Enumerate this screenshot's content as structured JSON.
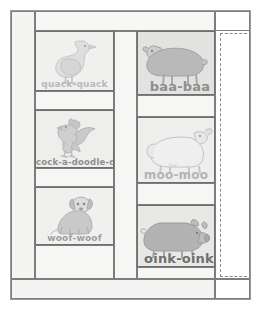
{
  "layout": {
    "top_bar_label": "",
    "bottom_bar_label": "",
    "right_margin_label": ""
  },
  "panels": [
    {
      "id": "duck",
      "animal": "goose",
      "icon": "goose-icon",
      "label": "quack-quack",
      "column": "left",
      "row": 1
    },
    {
      "id": "rooster",
      "animal": "rooster",
      "icon": "rooster-icon",
      "label": "cock-a-doodle-doo",
      "column": "left",
      "row": 2
    },
    {
      "id": "dog",
      "animal": "dog",
      "icon": "dog-icon",
      "label": "woof-woof",
      "column": "left",
      "row": 3
    },
    {
      "id": "sheep",
      "animal": "sheep",
      "icon": "sheep-icon",
      "label": "baa-baa",
      "column": "right",
      "row": 1
    },
    {
      "id": "cow",
      "animal": "cow",
      "icon": "cow-icon",
      "label": "moo-moo",
      "column": "right",
      "row": 2
    },
    {
      "id": "pig",
      "animal": "pig",
      "icon": "pig-icon",
      "label": "oink-oink",
      "column": "right",
      "row": 3
    }
  ],
  "colors": {
    "page_background": "#ffffff",
    "cell_background": "#f4f4f2",
    "panel_background": "#ececea",
    "border": "#7d7d7d",
    "panel_border": "#6f6f6f",
    "label_light": "#b9b9b9",
    "label_dark": "#6f6f6f",
    "dashed_guide": "#8a8a8a"
  }
}
